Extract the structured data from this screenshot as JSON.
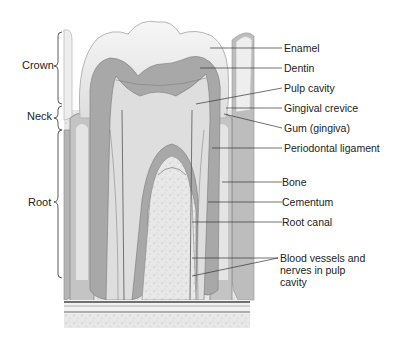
{
  "diagram": {
    "regions": [
      {
        "label": "Crown"
      },
      {
        "label": "Neck"
      },
      {
        "label": "Root"
      }
    ],
    "labels": [
      {
        "label": "Enamel"
      },
      {
        "label": "Dentin"
      },
      {
        "label": "Pulp cavity"
      },
      {
        "label": "Gingival crevice"
      },
      {
        "label": "Gum (gingiva)"
      },
      {
        "label": "Periodontal ligament"
      },
      {
        "label": "Bone"
      },
      {
        "label": "Cementum"
      },
      {
        "label": "Root canal"
      },
      {
        "label": "Blood vessels and",
        "line2": "nerves in pulp",
        "line3": "cavity"
      }
    ],
    "colors": {
      "enamel": "#efefef",
      "dentin": "#a9a9a9",
      "pulp": "#dcdcdc",
      "bone": "#e6e6e6",
      "gum": "#bdbdbd",
      "line": "#333333"
    }
  }
}
